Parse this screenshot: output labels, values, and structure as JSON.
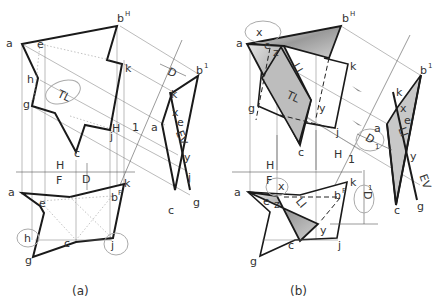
{
  "figure": {
    "panels": [
      {
        "caption": "(a)",
        "top_view": {
          "vertices": {
            "a": "a",
            "bH": "b",
            "bH_sup": "H",
            "e": "e",
            "h": "h",
            "g": "g",
            "k": "k",
            "j": "j",
            "c": "c"
          },
          "annotation": "TL"
        },
        "aux_view": {
          "vertices": {
            "b1": "b",
            "b1_sup": "1",
            "k": "k",
            "x": "x",
            "e": "e",
            "a": "a",
            "y": "y",
            "j": "j",
            "c": "c",
            "g": "g"
          },
          "annotation": "EV",
          "distance_label": "D"
        },
        "fold_lines": {
          "H1_H": "H",
          "H1_1": "1",
          "HF_H": "H",
          "HF_F": "F"
        },
        "front_view": {
          "vertices": {
            "a": "a",
            "e": "e",
            "bF": "b",
            "bF_sup": "F",
            "k": "k",
            "h": "h",
            "c": "c",
            "j": "j",
            "g": "g"
          },
          "distance_label": "D"
        }
      },
      {
        "caption": "(b)",
        "top_view": {
          "vertices": {
            "x": "x",
            "a": "a",
            "e": "e",
            "z": "z",
            "bH": "b",
            "bH_sup": "H",
            "k": "k",
            "g": "g",
            "y": "y",
            "j": "j",
            "c": "c"
          },
          "annotations": {
            "li": "LI",
            "tl": "TL"
          }
        },
        "aux_view": {
          "vertices": {
            "b1": "b",
            "b1_sup": "1",
            "k": "k",
            "x": "x",
            "e": "e",
            "a": "a",
            "y": "y",
            "c": "c",
            "g": "g"
          },
          "annotations": {
            "li": "LI",
            "ev": "EV"
          },
          "distance_label": "D",
          "distance_sub": "1"
        },
        "fold_lines": {
          "H1_H": "H",
          "H1_1": "1",
          "HF_H": "H",
          "HF_F": "F"
        },
        "front_view": {
          "vertices": {
            "x": "x",
            "a": "a",
            "e": "e",
            "z": "z",
            "bF": "b",
            "bF_sup": "F",
            "k": "k",
            "y": "y",
            "c": "c",
            "j": "j",
            "g": "g"
          },
          "annotations": {
            "li": "LI"
          },
          "distance_label": "D",
          "distance_sub": "1"
        }
      }
    ]
  }
}
